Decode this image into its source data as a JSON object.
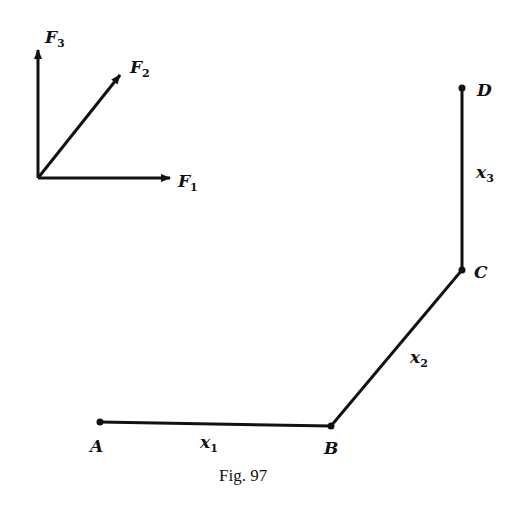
{
  "figure": {
    "caption": "Fig. 97",
    "forces": [
      {
        "letter": "F",
        "sub": "1",
        "direction": "horizontal-right"
      },
      {
        "letter": "F",
        "sub": "2",
        "direction": "diagonal-up-right"
      },
      {
        "letter": "F",
        "sub": "3",
        "direction": "vertical-up"
      }
    ],
    "points": [
      {
        "label": "A"
      },
      {
        "label": "B"
      },
      {
        "label": "C"
      },
      {
        "label": "D"
      }
    ],
    "segments": [
      {
        "letter": "x",
        "sub": "1",
        "from": "A",
        "to": "B"
      },
      {
        "letter": "x",
        "sub": "2",
        "from": "B",
        "to": "C"
      },
      {
        "letter": "x",
        "sub": "3",
        "from": "C",
        "to": "D"
      }
    ],
    "colors": {
      "ink": "#111111",
      "background": "#ffffff"
    }
  }
}
